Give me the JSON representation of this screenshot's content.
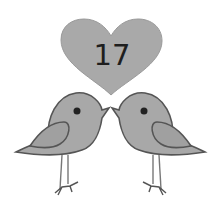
{
  "heart": {
    "label": "17",
    "fill": "#a9a9a9",
    "stroke": "#9a9a9a"
  },
  "birds": [
    {
      "side": "left",
      "facing": "right",
      "fill": "#a8a8a8",
      "stroke": "#555555"
    },
    {
      "side": "right",
      "facing": "left",
      "fill": "#a8a8a8",
      "stroke": "#555555"
    }
  ]
}
